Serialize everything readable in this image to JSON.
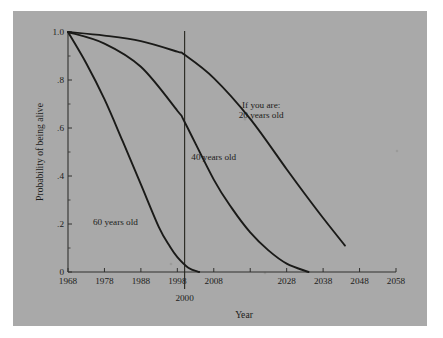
{
  "chart_data": {
    "type": "line",
    "title": "",
    "xlabel": "Year",
    "ylabel": "Probability of being alive",
    "xlim": [
      1968,
      2058
    ],
    "ylim": [
      0,
      1.0
    ],
    "grid": false,
    "legend_position": "inline-annotations",
    "xticks": [
      1968,
      1978,
      1988,
      1998,
      2008,
      2018,
      2028,
      2038,
      2048,
      2058
    ],
    "xtick_labels": [
      "1968",
      "1978",
      "1988",
      "1998",
      "2008",
      "",
      "2028",
      "2038",
      "2048",
      "2058"
    ],
    "xtick_labels_shown": [
      "1968",
      "1978",
      "1988",
      "1998",
      "2008",
      "2028",
      "2038",
      "2048",
      "2058"
    ],
    "yticks": [
      0,
      0.2,
      0.4,
      0.6,
      0.8,
      1.0
    ],
    "ytick_labels": [
      "0",
      ".2",
      ".4",
      ".6",
      ".8",
      "1.0"
    ],
    "yminor_ticks": [
      0.1,
      0.3,
      0.5,
      0.7,
      0.9
    ],
    "reference_line": {
      "x": 2000,
      "label": "2000"
    },
    "annotations": [
      {
        "name": "if-you-are",
        "lines": [
          "If you are:",
          "20 years old"
        ],
        "x": 2021,
        "y": 0.685
      },
      {
        "name": "forty",
        "lines": [
          "40 years old"
        ],
        "x": 2008,
        "y": 0.465
      },
      {
        "name": "sixty",
        "lines": [
          "60 years old"
        ],
        "x": 1981,
        "y": 0.195
      }
    ],
    "series": [
      {
        "name": "20 years old",
        "x": [
          1968,
          1978,
          1988,
          1998,
          2000,
          2008,
          2018,
          2028,
          2033,
          2038,
          2044
        ],
        "values": [
          1.0,
          0.985,
          0.962,
          0.918,
          0.905,
          0.808,
          0.638,
          0.428,
          0.325,
          0.225,
          0.11
        ]
      },
      {
        "name": "40 years old",
        "x": [
          1968,
          1978,
          1988,
          1998,
          2000,
          2008,
          2013,
          2018,
          2023,
          2028,
          2034
        ],
        "values": [
          1.0,
          0.952,
          0.855,
          0.672,
          0.625,
          0.385,
          0.265,
          0.165,
          0.09,
          0.035,
          0.0
        ]
      },
      {
        "name": "60 years old",
        "x": [
          1968,
          1973,
          1978,
          1983,
          1988,
          1993,
          1996,
          1998,
          2001,
          2004
        ],
        "values": [
          1.0,
          0.87,
          0.72,
          0.545,
          0.365,
          0.185,
          0.105,
          0.062,
          0.018,
          0.0
        ]
      }
    ]
  },
  "figure": {
    "background_color": "#a9a9a9",
    "page_color": "#ffffff",
    "ink_color": "#1a1a18"
  }
}
